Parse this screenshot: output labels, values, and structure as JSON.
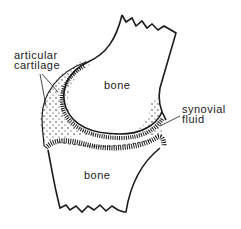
{
  "diagram": {
    "labels": {
      "articular_cartilage_line1": "articular",
      "articular_cartilage_line2": "cartilage",
      "upper_bone": "bone",
      "lower_bone": "bone",
      "synovial_fluid_line1": "synovial",
      "synovial_fluid_line2": "fluid"
    },
    "colors": {
      "ink": "#1a1a1a",
      "background": "#ffffff"
    }
  }
}
